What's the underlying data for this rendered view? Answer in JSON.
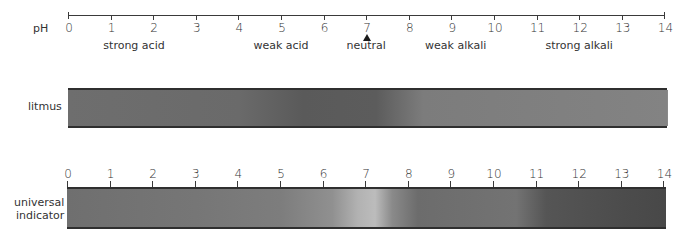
{
  "scale": {
    "label": "pH",
    "ticks": [
      "0",
      "1",
      "2",
      "3",
      "4",
      "5",
      "6",
      "7",
      "8",
      "9",
      "10",
      "11",
      "12",
      "13",
      "14"
    ],
    "descriptors": [
      {
        "text": "strong acid",
        "ph": 1.55
      },
      {
        "text": "weak acid",
        "ph": 5.0
      },
      {
        "text": "neutral",
        "ph": 7.0
      },
      {
        "text": "weak alkali",
        "ph": 9.1
      },
      {
        "text": "strong alkali",
        "ph": 12.0
      }
    ],
    "neutral_marker": "triangle-up"
  },
  "litmus": {
    "label": "litmus",
    "colors": [
      {
        "ph": 0,
        "color": "#6e6e6e"
      },
      {
        "ph": 4,
        "color": "#6a6a6a"
      },
      {
        "ph": 5.5,
        "color": "#5a5a5a"
      },
      {
        "ph": 7.2,
        "color": "#5c5c5c"
      },
      {
        "ph": 8.3,
        "color": "#7c7c7c"
      },
      {
        "ph": 14,
        "color": "#838383"
      }
    ]
  },
  "universal_indicator": {
    "label_line1": "universal",
    "label_line2": "indicator",
    "ticks": [
      "0",
      "1",
      "2",
      "3",
      "4",
      "5",
      "6",
      "7",
      "8",
      "9",
      "10",
      "11",
      "12",
      "13",
      "14"
    ],
    "colors": [
      {
        "ph": 0,
        "color": "#6f6f6f"
      },
      {
        "ph": 3,
        "color": "#767676"
      },
      {
        "ph": 5,
        "color": "#7d7d7d"
      },
      {
        "ph": 6.2,
        "color": "#909090"
      },
      {
        "ph": 6.8,
        "color": "#b2b2b2"
      },
      {
        "ph": 7.2,
        "color": "#bcbcbc"
      },
      {
        "ph": 7.6,
        "color": "#8a8a8a"
      },
      {
        "ph": 8.2,
        "color": "#6c6c6c"
      },
      {
        "ph": 10.5,
        "color": "#737373"
      },
      {
        "ph": 11.2,
        "color": "#555555"
      },
      {
        "ph": 13,
        "color": "#4c4c4c"
      },
      {
        "ph": 14,
        "color": "#484848"
      }
    ]
  }
}
